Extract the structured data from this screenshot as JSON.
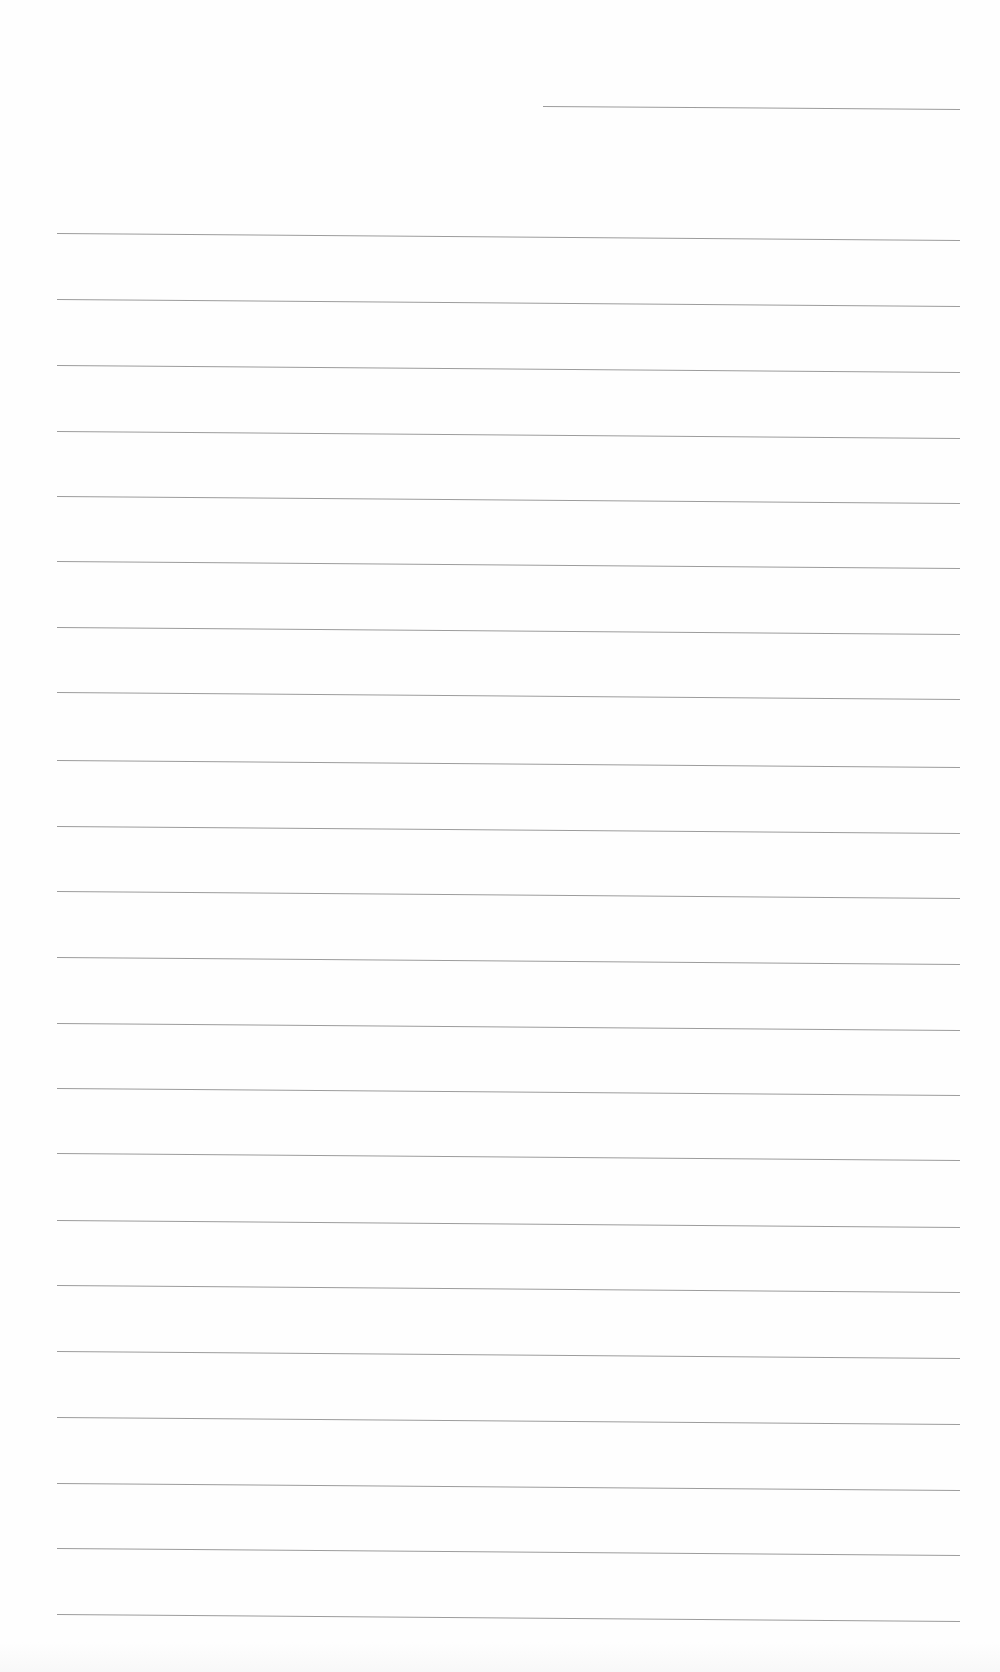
{
  "document": {
    "type": "blank ruled sheet",
    "line_color": "#9c9c9c",
    "background_color": "#fefefe",
    "header_line": {
      "x1": 543,
      "x2": 960,
      "y": 106,
      "slope_px": 3
    },
    "ruled_lines": {
      "x1": 57,
      "x2": 960,
      "slope_px": 7,
      "y_positions": [
        233,
        299,
        365,
        431,
        496,
        561,
        627,
        692,
        760,
        826,
        891,
        957,
        1023,
        1088,
        1153,
        1220,
        1285,
        1351,
        1417,
        1483,
        1548,
        1614
      ]
    }
  }
}
